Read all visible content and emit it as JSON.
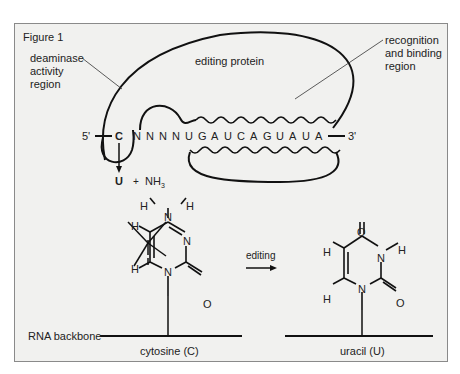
{
  "figure": {
    "title": "Figure 1",
    "labels": {
      "deaminase": [
        "deaminase",
        "activity",
        "region"
      ],
      "editing_protein": "editing protein",
      "recognition": [
        "recognition",
        "and binding",
        "region"
      ],
      "five_prime": "5'",
      "three_prime": "3'",
      "edited_base": "C",
      "product_base": "U",
      "plus": "+",
      "ammonia": "NH",
      "ammonia_sub": "3",
      "editing_arrow": "editing",
      "rna_backbone": "RNA backbone",
      "cytosine": "cytosine (C)",
      "uracil": "uracil (U)"
    },
    "sequence": [
      "N",
      "N",
      "N",
      "N",
      "U",
      "G",
      "A",
      "U",
      "C",
      "A",
      "G",
      "U",
      "A",
      "U",
      "A"
    ],
    "cytosine_atoms": {
      "H1": "H",
      "H2": "H",
      "N4": "N",
      "N3": "N",
      "O2": "O",
      "N1": "N",
      "H5": "H",
      "H6": "H"
    },
    "uracil_atoms": {
      "O4": "O",
      "N3": "N",
      "H3": "H",
      "O2": "O",
      "N1": "N",
      "H5": "H",
      "H6": "H"
    }
  }
}
